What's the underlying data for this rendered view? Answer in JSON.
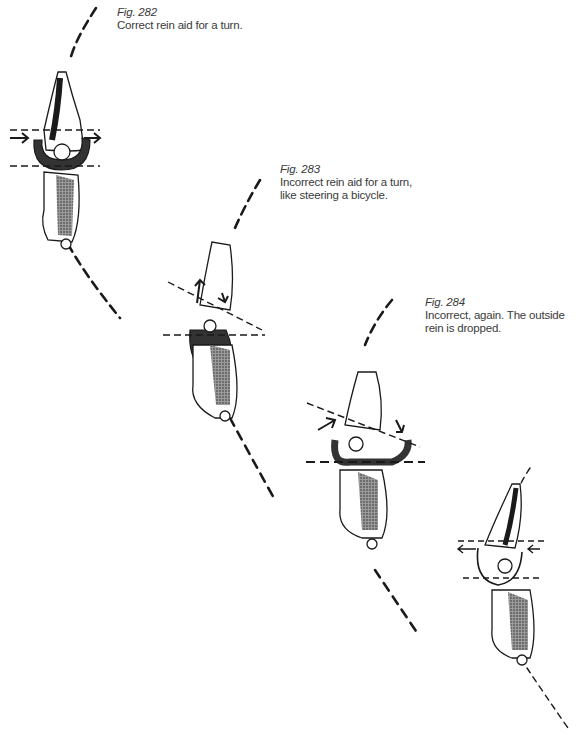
{
  "figures": [
    {
      "number": "Fig. 282",
      "caption_lines": [
        "Correct rein aid for a turn."
      ]
    },
    {
      "number": "Fig. 283",
      "caption_lines": [
        "Incorrect rein aid for a turn,",
        "like steering a bicycle."
      ]
    },
    {
      "number": "Fig. 284",
      "caption_lines": [
        "Incorrect, again. The outside",
        "rein is dropped."
      ]
    },
    {
      "number": "",
      "caption_lines": []
    }
  ],
  "colors": {
    "ink": "#1a1a1a",
    "caption_text": "#3a3a3a",
    "background": "#ffffff",
    "shading": "#555555"
  }
}
